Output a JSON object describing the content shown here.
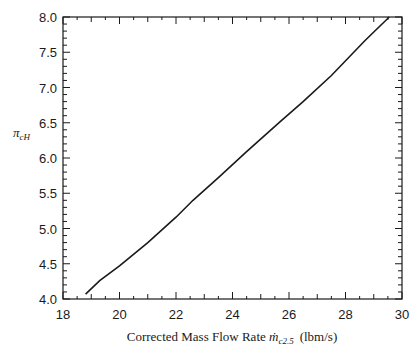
{
  "chart_data": {
    "type": "line",
    "title": "",
    "xlabel": "Corrected Mass Flow Rate ṁ_c2.5 (lbm/s)",
    "xlabel_parts": {
      "main": "Corrected Mass Flow Rate ",
      "symbol": "ṁ",
      "subscript": "c2.5",
      "units": "(lbm/s)"
    },
    "ylabel": "π_cH",
    "ylabel_parts": {
      "symbol": "π",
      "subscript": "cH"
    },
    "xlim": [
      18,
      30
    ],
    "ylim": [
      4.0,
      8.0
    ],
    "xticks": [
      18,
      20,
      22,
      24,
      26,
      28,
      30
    ],
    "xtick_labels": [
      "18",
      "20",
      "22",
      "24",
      "26",
      "28",
      "30"
    ],
    "yticks": [
      4.0,
      4.5,
      5.0,
      5.5,
      6.0,
      6.5,
      7.0,
      7.5,
      8.0
    ],
    "ytick_labels": [
      "4.0",
      "4.5",
      "5.0",
      "5.5",
      "6.0",
      "6.5",
      "7.0",
      "7.5",
      "8.0"
    ],
    "grid": false,
    "legend": null,
    "series": [
      {
        "name": "π_cH vs corrected mass flow",
        "color": "#1a1a1a",
        "x": [
          18.8,
          19.3,
          20.0,
          21.0,
          22.0,
          22.6,
          23.5,
          24.5,
          25.7,
          26.5,
          27.5,
          28.7,
          29.55
        ],
        "y": [
          4.07,
          4.26,
          4.47,
          4.8,
          5.16,
          5.4,
          5.72,
          6.09,
          6.52,
          6.8,
          7.17,
          7.67,
          8.0
        ]
      }
    ]
  }
}
